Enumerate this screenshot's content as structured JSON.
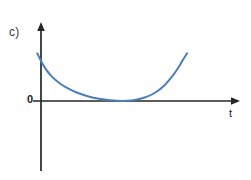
{
  "figure": {
    "part_label": "c)",
    "background_color": "#ffffff",
    "width": 251,
    "height": 180
  },
  "axes": {
    "x_axis_label": "t",
    "y_axis_label": "",
    "origin_label": "0",
    "axis_color": "#262626",
    "x_axis_y_px": 101,
    "y_axis_x_px": 41,
    "x_axis_start_px": 33,
    "x_axis_end_px": 240,
    "y_axis_top_px": 23,
    "y_axis_bottom_px": 171,
    "arrow_x_positive": true,
    "arrow_y_positive": true
  },
  "chart_data": {
    "type": "line",
    "title": "c)",
    "xlabel": "t",
    "ylabel": "",
    "grid": false,
    "legend": null,
    "series": [
      {
        "name": "curve",
        "color": "#4a7ebb",
        "line_width": 2,
        "description": "Upward-opening convex curve, tangent to the t-axis at its minimum; decreases steeply from the upper left, flattens to touch zero, then rises again to the right.",
        "x": [
          -0.18,
          0.0,
          0.25,
          0.55,
          0.9,
          1.3,
          1.75,
          2.25,
          2.8,
          3.35,
          3.9,
          4.45,
          5.0,
          5.5,
          5.95,
          6.3,
          6.6,
          6.85,
          7.05
        ],
        "y": [
          2.2,
          1.85,
          1.45,
          1.1,
          0.82,
          0.58,
          0.38,
          0.22,
          0.1,
          0.03,
          0.0,
          0.04,
          0.16,
          0.38,
          0.72,
          1.1,
          1.5,
          1.9,
          2.2
        ]
      }
    ],
    "xlim": [
      -0.4,
      9.6
    ],
    "ylim": [
      -2.6,
      3.6
    ],
    "annotations": [
      {
        "text": "0",
        "x_px": 31,
        "y_px": 101,
        "role": "origin-marker"
      },
      {
        "text": "t",
        "x_px": 232,
        "y_px": 113,
        "role": "axis-name"
      },
      {
        "text": "c)",
        "x_px": 12,
        "y_px": 32,
        "role": "part-label"
      }
    ]
  },
  "colors": {
    "curve": "#4a7ebb",
    "axis": "#262626",
    "label_text": "#3b3b3b",
    "background": "#ffffff"
  }
}
